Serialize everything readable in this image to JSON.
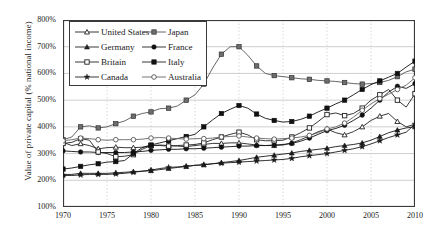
{
  "chart_data": {
    "type": "line",
    "title": "",
    "xlabel": "",
    "ylabel": "Value of private capital (% national income)",
    "xlim": [
      1970,
      2010
    ],
    "ylim": [
      100,
      800
    ],
    "yticks": [
      "100%",
      "200%",
      "300%",
      "400%",
      "500%",
      "600%",
      "700%",
      "800%"
    ],
    "ytick_values": [
      100,
      200,
      300,
      400,
      500,
      600,
      700,
      800
    ],
    "xticks": [
      "1970",
      "1975",
      "1980",
      "1985",
      "1990",
      "1995",
      "2000",
      "2005",
      "2010"
    ],
    "xtick_values": [
      1970,
      1975,
      1980,
      1985,
      1990,
      1995,
      2000,
      2005,
      2010
    ],
    "grid": true,
    "legend_position": "top-left",
    "x": [
      1970,
      1971,
      1972,
      1973,
      1974,
      1975,
      1976,
      1977,
      1978,
      1979,
      1980,
      1981,
      1982,
      1983,
      1984,
      1985,
      1986,
      1987,
      1988,
      1989,
      1990,
      1991,
      1992,
      1993,
      1994,
      1995,
      1996,
      1997,
      1998,
      1999,
      2000,
      2001,
      2002,
      2003,
      2004,
      2005,
      2006,
      2007,
      2008,
      2009,
      2010
    ],
    "series": [
      {
        "name": "United States",
        "marker": "open-triangle",
        "color": "#222222",
        "values": [
          342,
          330,
          337,
          330,
          318,
          322,
          324,
          322,
          322,
          324,
          330,
          332,
          330,
          328,
          326,
          330,
          334,
          338,
          338,
          340,
          340,
          336,
          332,
          330,
          330,
          332,
          340,
          352,
          366,
          382,
          392,
          378,
          370,
          382,
          400,
          424,
          440,
          450,
          420,
          400,
          410
        ]
      },
      {
        "name": "Japan",
        "marker": "filled-square-gray",
        "color": "#555555",
        "values": [
          352,
          362,
          400,
          404,
          396,
          400,
          412,
          422,
          440,
          450,
          456,
          468,
          470,
          478,
          500,
          520,
          560,
          620,
          672,
          700,
          700,
          668,
          628,
          600,
          592,
          588,
          584,
          580,
          578,
          574,
          572,
          570,
          566,
          562,
          560,
          562,
          566,
          574,
          588,
          606,
          616
        ]
      },
      {
        "name": "Germany",
        "marker": "filled-triangle",
        "color": "#1a1a1a",
        "values": [
          222,
          222,
          226,
          226,
          226,
          226,
          228,
          230,
          232,
          234,
          236,
          240,
          244,
          248,
          252,
          256,
          258,
          262,
          266,
          270,
          274,
          280,
          286,
          290,
          294,
          298,
          302,
          308,
          312,
          316,
          320,
          326,
          330,
          334,
          340,
          350,
          364,
          378,
          388,
          396,
          400
        ]
      },
      {
        "name": "France",
        "marker": "filled-circle",
        "color": "#111111",
        "values": [
          310,
          308,
          306,
          306,
          304,
          304,
          304,
          304,
          306,
          308,
          312,
          314,
          316,
          316,
          318,
          318,
          320,
          322,
          324,
          326,
          328,
          328,
          330,
          330,
          332,
          334,
          338,
          346,
          358,
          372,
          386,
          394,
          406,
          424,
          444,
          470,
          500,
          530,
          552,
          544,
          562
        ]
      },
      {
        "name": "Britain",
        "marker": "open-square",
        "color": "#222222",
        "values": [
          338,
          342,
          356,
          350,
          306,
          300,
          288,
          290,
          296,
          316,
          330,
          330,
          328,
          330,
          332,
          334,
          340,
          352,
          362,
          372,
          380,
          370,
          352,
          348,
          348,
          350,
          362,
          378,
          396,
          420,
          446,
          452,
          442,
          450,
          470,
          500,
          520,
          540,
          500,
          474,
          524
        ]
      },
      {
        "name": "Italy",
        "marker": "filled-square-black",
        "color": "#111111",
        "values": [
          242,
          246,
          252,
          258,
          262,
          268,
          270,
          274,
          300,
          322,
          332,
          340,
          348,
          356,
          364,
          372,
          400,
          426,
          450,
          466,
          480,
          470,
          448,
          432,
          424,
          418,
          420,
          428,
          440,
          456,
          470,
          486,
          500,
          520,
          540,
          558,
          572,
          586,
          600,
          624,
          646
        ]
      },
      {
        "name": "Canada",
        "marker": "filled-star",
        "color": "#1a1a1a",
        "values": [
          218,
          218,
          220,
          222,
          222,
          222,
          224,
          226,
          230,
          234,
          238,
          244,
          248,
          250,
          252,
          256,
          258,
          262,
          264,
          266,
          268,
          270,
          272,
          274,
          276,
          278,
          282,
          288,
          292,
          296,
          300,
          306,
          312,
          318,
          326,
          336,
          348,
          360,
          370,
          380,
          410
        ]
      },
      {
        "name": "Australia",
        "marker": "open-circle-gray",
        "color": "#666666",
        "values": [
          348,
          352,
          358,
          356,
          352,
          350,
          352,
          352,
          352,
          354,
          358,
          360,
          358,
          356,
          354,
          356,
          356,
          358,
          362,
          364,
          366,
          362,
          358,
          356,
          354,
          356,
          358,
          362,
          368,
          378,
          392,
          400,
          414,
          436,
          462,
          486,
          506,
          522,
          540,
          556,
          584
        ]
      }
    ]
  },
  "legend": {
    "items": [
      {
        "label": "United States",
        "marker": "open-triangle"
      },
      {
        "label": "Germany",
        "marker": "filled-triangle"
      },
      {
        "label": "Britain",
        "marker": "open-square"
      },
      {
        "label": "Canada",
        "marker": "filled-star"
      },
      {
        "label": "Japan",
        "marker": "filled-square-gray"
      },
      {
        "label": "France",
        "marker": "filled-circle"
      },
      {
        "label": "Italy",
        "marker": "filled-square-black"
      },
      {
        "label": "Australia",
        "marker": "open-circle-gray"
      }
    ]
  }
}
